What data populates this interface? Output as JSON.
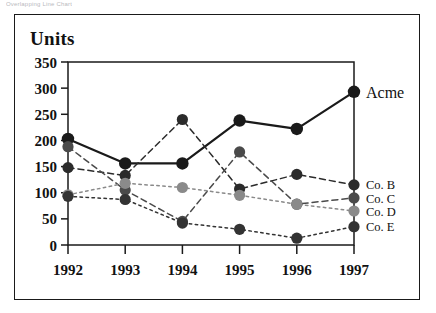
{
  "caption": "Overlapping Line Chart",
  "axes": {
    "ylabel": "Units",
    "yticks": [
      "350",
      "300",
      "250",
      "200",
      "150",
      "100",
      "50",
      "0"
    ],
    "xticks": [
      "1992",
      "1993",
      "1994",
      "1995",
      "1996",
      "1997"
    ]
  },
  "legend": [
    {
      "label": "Acme",
      "color": "#1a1a1a"
    },
    {
      "label": "Co. B",
      "color": "#2b2b2b"
    },
    {
      "label": "Co. C",
      "color": "#4a4a4a"
    },
    {
      "label": "Co. D",
      "color": "#8a8a8a"
    },
    {
      "label": "Co. E",
      "color": "#333333"
    }
  ],
  "colors": {
    "frame": "#1a1a1a",
    "axis": "#1a1a1a",
    "background": "#ffffff"
  },
  "chart_data": {
    "type": "line",
    "title": "Overlapping Line Chart",
    "xlabel": "",
    "ylabel": "Units",
    "categories": [
      "1992",
      "1993",
      "1994",
      "1995",
      "1996",
      "1997"
    ],
    "ylim": [
      0,
      350
    ],
    "ytick_step": 50,
    "grid": false,
    "legend_position": "right",
    "series": [
      {
        "name": "Acme",
        "color": "#1a1a1a",
        "style": "solid",
        "values": [
          203,
          156,
          156,
          238,
          222,
          293
        ]
      },
      {
        "name": "Co. B",
        "color": "#2b2b2b",
        "style": "dashed",
        "values": [
          148,
          133,
          240,
          107,
          135,
          115
        ]
      },
      {
        "name": "Co. C",
        "color": "#4a4a4a",
        "style": "dashed",
        "values": [
          188,
          105,
          45,
          178,
          78,
          90
        ]
      },
      {
        "name": "Co. D",
        "color": "#8a8a8a",
        "style": "dotted",
        "values": [
          96,
          118,
          110,
          95,
          78,
          65
        ]
      },
      {
        "name": "Co. E",
        "color": "#333333",
        "style": "dotted",
        "values": [
          93,
          87,
          42,
          30,
          13,
          35
        ]
      }
    ]
  }
}
